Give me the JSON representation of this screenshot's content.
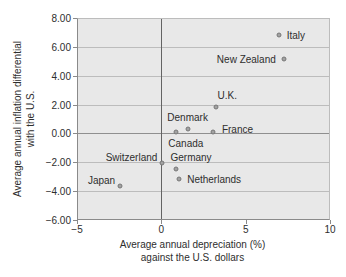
{
  "chart_data": {
    "type": "scatter",
    "title": "",
    "xlabel_lines": [
      "Average annual depreciation (%)",
      "against the U.S. dollars"
    ],
    "ylabel_lines": [
      "Average annual inflation differential",
      "with the U.S."
    ],
    "xlim": [
      -5,
      10
    ],
    "ylim": [
      -6,
      8
    ],
    "grid": "horizontal",
    "legend": "none",
    "x_ticks": [
      {
        "value": -5,
        "label": "−5"
      },
      {
        "value": 0,
        "label": "0"
      },
      {
        "value": 5,
        "label": "5"
      },
      {
        "value": 10,
        "label": "10"
      }
    ],
    "y_ticks": [
      {
        "value": 8,
        "label": "8.00"
      },
      {
        "value": 6,
        "label": "6.00"
      },
      {
        "value": 4,
        "label": "4.00"
      },
      {
        "value": 2,
        "label": "2.00"
      },
      {
        "value": 0,
        "label": "0.00"
      },
      {
        "value": -2,
        "label": "−2.00"
      },
      {
        "value": -4,
        "label": "−4.00"
      },
      {
        "value": -6,
        "label": "−6.00"
      }
    ],
    "points": [
      {
        "label": "Italy",
        "x": 6.9,
        "y": 6.9,
        "label_side": "right"
      },
      {
        "label": "New Zealand",
        "x": 7.2,
        "y": 5.2,
        "label_side": "left"
      },
      {
        "label": "U.K.",
        "x": 3.2,
        "y": 1.9,
        "label_side": "above-right"
      },
      {
        "label": "Denmark",
        "x": 1.5,
        "y": 0.4,
        "label_side": "above"
      },
      {
        "label": "France",
        "x": 3.0,
        "y": 0.2,
        "label_side": "right-up"
      },
      {
        "label": "Canada",
        "x": 0.8,
        "y": 0.2,
        "label_side": "below-right"
      },
      {
        "label": "Switzerland",
        "x": 0.0,
        "y": -2.0,
        "label_side": "left-up"
      },
      {
        "label": "Germany",
        "x": 0.8,
        "y": -2.4,
        "label_side": "above-right"
      },
      {
        "label": "Netherlands",
        "x": 1.0,
        "y": -3.1,
        "label_side": "right"
      },
      {
        "label": "Japan",
        "x": -2.5,
        "y": -3.6,
        "label_side": "left-up"
      }
    ],
    "colors": {
      "plot_bg": "#e8e8e8",
      "gridline": "#bcbcbc",
      "zero_line_horizontal": "#8f8f8f",
      "zero_line_vertical": "#636363",
      "axis": "#8a8a8a",
      "point": "#a2a2a2",
      "point_border": "#777777",
      "text": "#2e2e2e"
    }
  }
}
